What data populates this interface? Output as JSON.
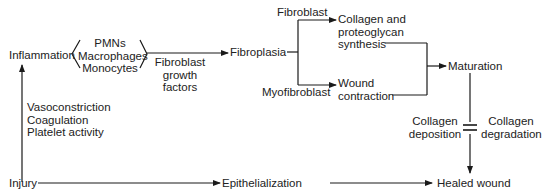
{
  "diagram": {
    "nodes": {
      "inflammation": "Inflammation",
      "cells": [
        "PMNs",
        "Macrophages",
        "Monocytes"
      ],
      "growth_factors": [
        "Fibroblast",
        "growth",
        "factors"
      ],
      "fibroplasia": "Fibroplasia",
      "fibroblast": "Fibroblast",
      "myofibroblast": "Myofibroblast",
      "collagen_synthesis": [
        "Collagen and",
        "proteoglycan",
        "synthesis"
      ],
      "wound_contraction": [
        "Wound",
        "contraction"
      ],
      "maturation": "Maturation",
      "collagen_deposition": [
        "Collagen",
        "deposition"
      ],
      "collagen_degradation": [
        "Collagen",
        "degradation"
      ],
      "hemostasis": [
        "Vasoconstriction",
        "Coagulation",
        "Platelet activity"
      ],
      "injury": "Injury",
      "epithelialization": "Epithelialization",
      "healed_wound": "Healed wound"
    },
    "edges": [
      {
        "from": "Injury",
        "to": "Inflammation",
        "label": "Vasoconstriction / Coagulation / Platelet activity"
      },
      {
        "from": "Inflammation",
        "to": "Fibroplasia",
        "label": "Fibroblast growth factors"
      },
      {
        "from": "Fibroplasia",
        "to": "Collagen and proteoglycan synthesis",
        "label": "Fibroblast"
      },
      {
        "from": "Fibroplasia",
        "to": "Wound contraction",
        "label": "Myofibroblast"
      },
      {
        "from": "Collagen and proteoglycan synthesis",
        "to": "Maturation"
      },
      {
        "from": "Wound contraction",
        "to": "Maturation"
      },
      {
        "from": "Maturation",
        "to": "Healed wound",
        "label": "Collagen deposition = Collagen degradation"
      },
      {
        "from": "Injury",
        "to": "Epithelialization"
      },
      {
        "from": "Epithelialization",
        "to": "Healed wound"
      }
    ],
    "line_color": "#1a1a1a"
  }
}
